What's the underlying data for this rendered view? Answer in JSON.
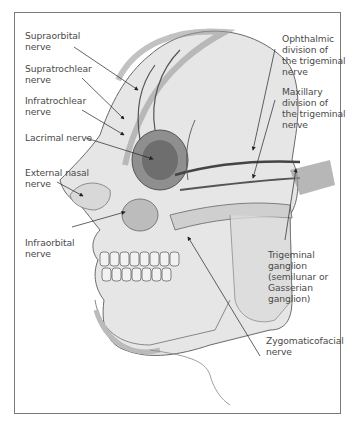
{
  "figure": {
    "labels": {
      "supraorbital": "Supraorbital\nnerve",
      "supratrochlear": "Supratrochlear\nnerve",
      "infratrochlear": "Infratrochlear\nnerve",
      "lacrimal": "Lacrimal nerve",
      "external_nasal": "External nasal\nnerve",
      "infraorbital": "Infraorbital\nnerve",
      "ophthalmic": "Ophthalmic\ndivision of\nthe trigeminal\nnerve",
      "maxillary": "Maxillary\ndivision of\nthe trigeminal\nnerve",
      "trigeminal_ganglion": "Trigeminal\nganglion\n(semilunar or\nGasserian\nganglion)",
      "zygomaticofacial": "Zygomaticofacial\nnerve"
    }
  }
}
